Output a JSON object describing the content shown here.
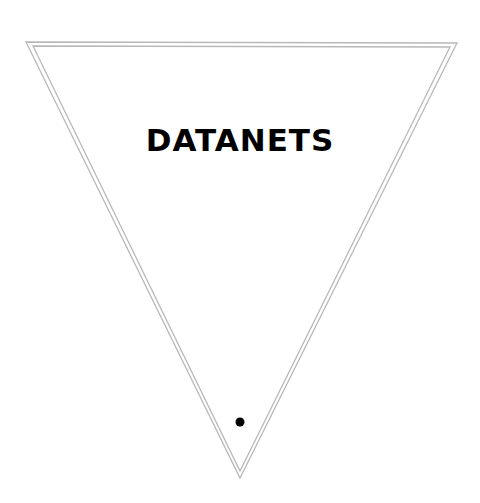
{
  "pennant": {
    "title": "DATANETS",
    "border_color": "#b8b8b8",
    "text_color": "#000000",
    "hole_color": "#000000"
  }
}
